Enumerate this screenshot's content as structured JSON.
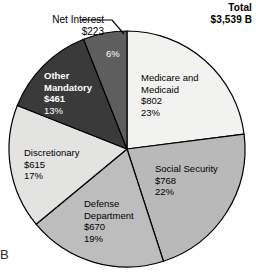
{
  "header": {
    "total_label": "Total",
    "total_value": "$3,539 B"
  },
  "callout": {
    "net_interest_name": "Net Interest",
    "net_interest_value": "$223"
  },
  "corner_mark": "B",
  "chart_data": {
    "type": "pie",
    "title": "Total",
    "total": "$3,539 B",
    "total_value": 3539,
    "units": "billions of dollars",
    "start_angle_deg": 0,
    "direction": "clockwise",
    "legend": "none-inline-labels",
    "categories": [
      "Medicare and Medicaid",
      "Social Security",
      "Defense Department",
      "Discretionary",
      "Other Mandatory",
      "Net Interest"
    ],
    "values": [
      802,
      768,
      670,
      615,
      461,
      223
    ],
    "percents": [
      23,
      22,
      19,
      17,
      13,
      6
    ],
    "colors": [
      "#f2f2f0",
      "#b9b9b9",
      "#bdbdbd",
      "#e3e3e1",
      "#3a3a3a",
      "#5e5e5e"
    ],
    "slices": [
      {
        "name": "Medicare and Medicaid",
        "name_line1": "Medicare and",
        "name_line2": "Medicaid",
        "value": "$802",
        "percent": "23%",
        "color": "#f2f2f0",
        "text_color": "#000000"
      },
      {
        "name": "Social Security",
        "name_line1": "Social Security",
        "name_line2": "",
        "value": "$768",
        "percent": "22%",
        "color": "#b9b9b9",
        "text_color": "#000000"
      },
      {
        "name": "Defense Department",
        "name_line1": "Defense",
        "name_line2": "Department",
        "value": "$670",
        "percent": "19%",
        "color": "#bdbdbd",
        "text_color": "#000000"
      },
      {
        "name": "Discretionary",
        "name_line1": "Discretionary",
        "name_line2": "",
        "value": "$615",
        "percent": "17%",
        "color": "#e3e3e1",
        "text_color": "#000000"
      },
      {
        "name": "Other Mandatory",
        "name_line1": "Other",
        "name_line2": "Mandatory",
        "value": "$461",
        "percent": "13%",
        "color": "#3a3a3a",
        "text_color": "#ffffff"
      },
      {
        "name": "Net Interest",
        "name_line1": "Net Interest",
        "name_line2": "",
        "value": "$223",
        "percent": "6%",
        "color": "#5e5e5e",
        "text_color": "#ffffff"
      }
    ]
  }
}
